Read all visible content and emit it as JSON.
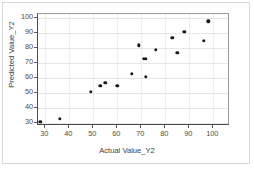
{
  "chart_data": {
    "type": "scatter",
    "title": "",
    "xlabel": "Actual Value_Y2",
    "ylabel": "Predicted Value_Y2",
    "xlim": [
      27,
      107
    ],
    "ylim": [
      28,
      103
    ],
    "xticks": [
      30,
      40,
      50,
      60,
      70,
      80,
      90,
      100
    ],
    "yticks": [
      30,
      40,
      50,
      60,
      70,
      80,
      90,
      100
    ],
    "grid": true,
    "legend": null,
    "marker": "filled-circle",
    "marker_color": "#1a1a1a",
    "series": [
      {
        "name": "Predicted vs Actual",
        "points": [
          [
            28,
            31
          ],
          [
            36,
            33
          ],
          [
            49,
            51
          ],
          [
            53,
            55
          ],
          [
            55,
            57
          ],
          [
            60,
            55
          ],
          [
            66,
            63
          ],
          [
            69,
            82
          ],
          [
            71,
            73
          ],
          [
            72,
            73
          ],
          [
            72,
            61
          ],
          [
            76,
            79
          ],
          [
            83,
            87
          ],
          [
            85,
            77
          ],
          [
            88,
            91
          ],
          [
            96,
            85
          ],
          [
            98,
            98
          ]
        ]
      }
    ]
  }
}
